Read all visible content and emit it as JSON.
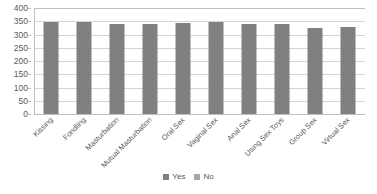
{
  "chart_data": {
    "type": "bar",
    "title": "",
    "xlabel": "",
    "ylabel": "",
    "ylim": [
      0,
      400
    ],
    "ytick_labels": [
      "400",
      "350",
      "300",
      "250",
      "200",
      "150",
      "100",
      "50",
      "0"
    ],
    "ytick_values": [
      400,
      350,
      300,
      250,
      200,
      150,
      100,
      50,
      0
    ],
    "grid": true,
    "legend_position": "bottom-center",
    "categories": [
      "Kissing",
      "Fondling",
      "Masturbation",
      "Mutual Masturbation",
      "Oral Sex",
      "Vaginal Sex",
      "Anal Sex",
      "Using Sex Toys",
      "Group Sex",
      "Virtual Sex"
    ],
    "series": [
      {
        "name": "Yes",
        "color": "#808080",
        "values": [
          346,
          346,
          338,
          340,
          342,
          346,
          338,
          341,
          324,
          329
        ]
      },
      {
        "name": "No",
        "color": "#a6a6a6",
        "values": [
          0,
          0,
          0,
          0,
          0,
          0,
          0,
          0,
          0,
          0
        ]
      }
    ]
  },
  "legend": {
    "items": [
      {
        "label": "Yes",
        "color": "#808080"
      },
      {
        "label": "No",
        "color": "#a6a6a6"
      }
    ]
  },
  "colors": {
    "series_yes": "#808080",
    "series_no": "#a6a6a6",
    "gridline": "#d4d4d4",
    "axis": "#bfbfbf",
    "text": "#595959",
    "background": "#ffffff"
  }
}
